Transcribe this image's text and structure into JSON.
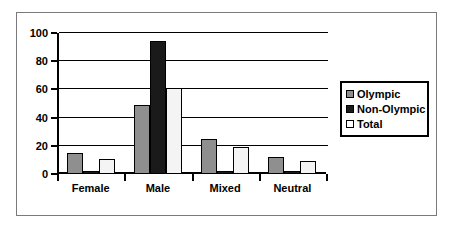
{
  "chart_data": {
    "type": "bar",
    "title": "",
    "xlabel": "",
    "ylabel": "",
    "categories": [
      "Female",
      "Male",
      "Mixed",
      "Neutral"
    ],
    "series": [
      {
        "name": "Olympic",
        "color": "#8f8f8f",
        "values": [
          15,
          49,
          25,
          12
        ]
      },
      {
        "name": "Non-Olympic",
        "color": "#1a1a1a",
        "values": [
          2,
          94,
          2,
          2
        ]
      },
      {
        "name": "Total",
        "color": "#f4f4f4",
        "values": [
          11,
          61,
          19,
          9
        ]
      }
    ],
    "ylim": [
      0,
      100
    ],
    "yticks": [
      0,
      20,
      40,
      60,
      80,
      100
    ],
    "ytick_labels": [
      "0",
      "20",
      "40",
      "60",
      "80",
      "100"
    ],
    "grid": true,
    "legend_position": "right"
  },
  "legend": {
    "entries": [
      {
        "label": "Olympic"
      },
      {
        "label": "Non-Olympic"
      },
      {
        "label": "Total"
      }
    ]
  },
  "axes": {
    "y_labels": [
      "100",
      "80",
      "60",
      "40",
      "20",
      "0"
    ],
    "x_labels": [
      "Female",
      "Male",
      "Mixed",
      "Neutral"
    ]
  }
}
